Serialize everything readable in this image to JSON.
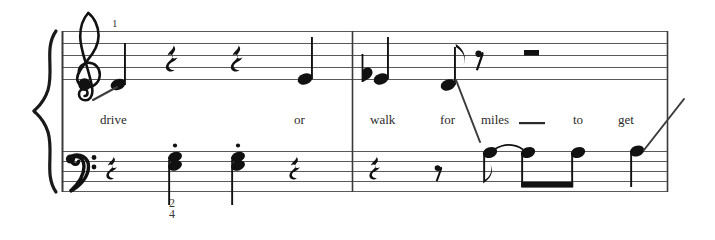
{
  "page": {
    "background": "#ffffff",
    "ink": "#1a1a1a",
    "staff_line_color": "#5a5a5a",
    "width": 715,
    "height": 240,
    "content_type": "piano-vocal-sheet-music-excerpt"
  },
  "system": {
    "brace": "piano-brace",
    "measure_number": "1",
    "time_signature": {
      "numerator": "2",
      "denominator": "4",
      "display": "2/4"
    },
    "staves": [
      {
        "name": "treble",
        "clef": "treble-clef",
        "clef_glyph": "𝄞"
      },
      {
        "name": "bass",
        "clef": "bass-clef",
        "clef_glyph": "𝄢"
      }
    ],
    "barlines": [
      "start",
      "middle",
      "end"
    ]
  },
  "lyrics": [
    {
      "text": "drive",
      "x": 100,
      "syllable_index": 0
    },
    {
      "text": "or",
      "x": 294,
      "syllable_index": 1
    },
    {
      "text": "walk",
      "x": 370,
      "syllable_index": 2
    },
    {
      "text": "for",
      "x": 440,
      "syllable_index": 3
    },
    {
      "text": "miles",
      "x": 481,
      "syllable_index": 4,
      "extender": true
    },
    {
      "text": "to",
      "x": 573,
      "syllable_index": 5
    },
    {
      "text": "get",
      "x": 618,
      "syllable_index": 6
    }
  ],
  "treble_measures": [
    {
      "index": 1,
      "symbols": [
        {
          "kind": "note",
          "duration": "quarter",
          "stem": "up",
          "lyric": "drive"
        },
        {
          "kind": "rest",
          "duration": "quarter"
        },
        {
          "kind": "rest",
          "duration": "quarter"
        },
        {
          "kind": "note",
          "duration": "quarter",
          "stem": "up",
          "lyric": "or"
        }
      ]
    },
    {
      "index": 2,
      "symbols": [
        {
          "kind": "note",
          "duration": "quarter",
          "stem": "up",
          "accidental": "flat",
          "lyric": "walk"
        },
        {
          "kind": "note",
          "duration": "eighth",
          "stem": "up",
          "flag": true,
          "lyric": "for"
        },
        {
          "kind": "rest",
          "duration": "eighth"
        },
        {
          "kind": "rest",
          "duration": "half"
        }
      ]
    }
  ],
  "bass_measures": [
    {
      "index": 1,
      "symbols": [
        {
          "kind": "rest",
          "duration": "quarter"
        },
        {
          "kind": "chord",
          "duration": "quarter",
          "stem": "down",
          "articulation": "staccato",
          "notes": 2
        },
        {
          "kind": "chord",
          "duration": "quarter",
          "stem": "down",
          "articulation": "staccato",
          "notes": 2
        },
        {
          "kind": "rest",
          "duration": "quarter"
        }
      ]
    },
    {
      "index": 2,
      "symbols": [
        {
          "kind": "rest",
          "duration": "quarter"
        },
        {
          "kind": "rest",
          "duration": "eighth"
        },
        {
          "kind": "note",
          "duration": "eighth",
          "stem": "down",
          "flag": true,
          "tie": "start"
        },
        {
          "kind": "note",
          "duration": "eighth",
          "stem": "down",
          "beamed": true,
          "tie": "end"
        },
        {
          "kind": "note",
          "duration": "eighth",
          "stem": "down",
          "beamed": true
        },
        {
          "kind": "note",
          "duration": "quarter",
          "stem": "down"
        }
      ]
    }
  ],
  "lyric_connector_lines": [
    {
      "name": "drive-lead-line",
      "from": [
        94,
        99
      ],
      "to": [
        118,
        85
      ]
    },
    {
      "name": "for-miles-line",
      "from": [
        455,
        80
      ],
      "to": [
        478,
        140
      ]
    },
    {
      "name": "get-rise-line",
      "from": [
        645,
        148
      ],
      "to": [
        684,
        100
      ]
    }
  ]
}
